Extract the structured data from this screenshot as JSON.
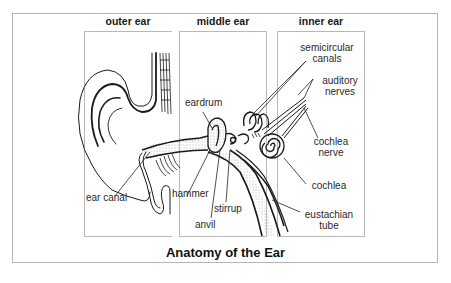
{
  "diagram": {
    "title": "Anatomy of the Ear",
    "sections": [
      {
        "label": "outer ear"
      },
      {
        "label": "middle ear"
      },
      {
        "label": "inner ear"
      }
    ],
    "labels": {
      "eardrum": "eardrum",
      "ear_canal": "ear canal",
      "hammer": "hammer",
      "anvil": "anvil",
      "stirrup": "stirrup",
      "semicircular_canals_1": "semicircular",
      "semicircular_canals_2": "canals",
      "auditory_nerves_1": "auditory",
      "auditory_nerves_2": "nerves",
      "cochlea_nerve_1": "cochlea",
      "cochlea_nerve_2": "nerve",
      "cochlea": "cochlea",
      "eustachian_tube_1": "eustachian",
      "eustachian_tube_2": "tube"
    },
    "colors": {
      "line": "#1a1a1a",
      "frame": "#b5b5b5",
      "background": "#ffffff"
    }
  }
}
